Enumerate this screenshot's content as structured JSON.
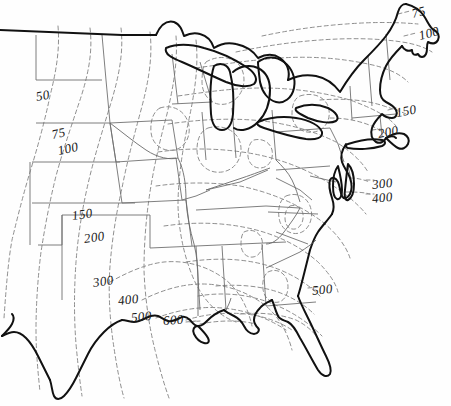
{
  "figure": {
    "kind": "contour-map",
    "region": "Central and Eastern United States",
    "background_color": "#fefefe",
    "coastline_color": "#111111",
    "state_border_color": "#6a6a6a",
    "contour_color": "#8a8a8a",
    "label_color": "#1a1a1a"
  },
  "chart_data": {
    "type": "contour",
    "title": "",
    "subtitle": "",
    "xlabel": "",
    "ylabel": "",
    "legend": [],
    "grid": false,
    "contour_levels": [
      50,
      75,
      100,
      150,
      200,
      300,
      400,
      500,
      600
    ],
    "labels": [
      {
        "id": "l1",
        "text": "50",
        "x": 36,
        "y": 89,
        "rotate": -10
      },
      {
        "id": "l2",
        "text": "75",
        "x": 52,
        "y": 127,
        "rotate": -12
      },
      {
        "id": "l3",
        "text": "100",
        "x": 58,
        "y": 143,
        "rotate": -12
      },
      {
        "id": "l4",
        "text": "150",
        "x": 72,
        "y": 208,
        "rotate": -8
      },
      {
        "id": "l5",
        "text": "200",
        "x": 84,
        "y": 231,
        "rotate": -8
      },
      {
        "id": "l6",
        "text": "300",
        "x": 93,
        "y": 275,
        "rotate": -8
      },
      {
        "id": "l7",
        "text": "400",
        "x": 118,
        "y": 293,
        "rotate": -6
      },
      {
        "id": "l8",
        "text": "500",
        "x": 131,
        "y": 310,
        "rotate": -6
      },
      {
        "id": "l9",
        "text": "600",
        "x": 163,
        "y": 313,
        "rotate": -4
      },
      {
        "id": "l10",
        "text": "500",
        "x": 312,
        "y": 283,
        "rotate": -6
      },
      {
        "id": "l11",
        "text": "300",
        "x": 372,
        "y": 177,
        "rotate": -6
      },
      {
        "id": "l12",
        "text": "400",
        "x": 372,
        "y": 191,
        "rotate": -6
      },
      {
        "id": "l13",
        "text": "150",
        "x": 396,
        "y": 105,
        "rotate": -10
      },
      {
        "id": "l14",
        "text": "200",
        "x": 378,
        "y": 126,
        "rotate": -10
      },
      {
        "id": "l15",
        "text": "75",
        "x": 412,
        "y": 6,
        "rotate": -14
      },
      {
        "id": "l16",
        "text": "100",
        "x": 419,
        "y": 28,
        "rotate": -14
      }
    ]
  }
}
